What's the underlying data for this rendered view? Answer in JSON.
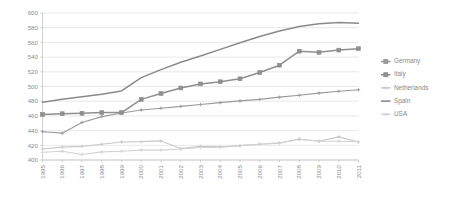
{
  "chart_data": {
    "type": "line",
    "title": "",
    "subtitle": "",
    "xlabel": "",
    "ylabel": "",
    "categories": [
      "1995",
      "1996",
      "1997",
      "1998",
      "1999",
      "2000",
      "2001",
      "2002",
      "2003",
      "2004",
      "2005",
      "2006",
      "2007",
      "2008",
      "2009",
      "2010",
      "2011"
    ],
    "xlim": [
      1995,
      2011
    ],
    "ylim": [
      400,
      600
    ],
    "ytick_values": [
      400,
      420,
      440,
      460,
      480,
      500,
      520,
      540,
      560,
      580,
      600
    ],
    "ytick_labels": [
      "400",
      "420",
      "440",
      "460",
      "480",
      "500",
      "520",
      "540",
      "560",
      "580",
      "600"
    ],
    "grid": "horizontal",
    "legend_position": "right",
    "series": [
      {
        "name": "Germany",
        "color": "#9a9a9a",
        "marker": "plus",
        "values": [
          438.5,
          436.5,
          451.0,
          459.0,
          464.0,
          468.0,
          470.5,
          473.0,
          475.5,
          478.0,
          480.5,
          482.5,
          485.5,
          488.0,
          491.0,
          493.5,
          495.5
        ]
      },
      {
        "name": "Italy",
        "color": "#8f8f8f",
        "marker": "square",
        "values": [
          462.0,
          463.0,
          463.5,
          464.5,
          464.5,
          482.5,
          490.5,
          498.0,
          503.5,
          506.5,
          510.5,
          519.0,
          529.0,
          548.0,
          546.5,
          549.5,
          551.5
        ]
      },
      {
        "name": "Netherlands",
        "color": "#c9c9c9",
        "marker": "plus",
        "values": [
          415.0,
          417.5,
          418.5,
          421.5,
          424.5,
          425.0,
          426.0,
          415.5,
          418.5,
          418.0,
          419.5,
          421.5,
          423.0,
          428.5,
          425.5,
          431.5,
          424.5
        ]
      },
      {
        "name": "Spain",
        "color": "#8a8a8a",
        "marker": "none",
        "values": [
          478.5,
          482.5,
          486.0,
          489.5,
          494.0,
          512.0,
          523.0,
          533.0,
          541.5,
          550.5,
          559.5,
          568.0,
          575.5,
          581.5,
          585.5,
          587.0,
          586.0
        ]
      },
      {
        "name": "USA",
        "color": "#d2d2d2",
        "marker": "plus",
        "values": [
          410.5,
          412.0,
          407.5,
          411.0,
          412.0,
          413.5,
          413.5,
          415.0,
          417.0,
          417.0,
          419.5,
          421.5,
          423.5,
          428.0,
          425.5,
          425.5,
          425.0
        ]
      }
    ],
    "legend": [
      {
        "label": "Germany",
        "color": "#9a9a9a",
        "marker": "square"
      },
      {
        "label": "Italy",
        "color": "#8f8f8f",
        "marker": "square"
      },
      {
        "label": "Netherlands",
        "color": "#c9c9c9",
        "marker": "plus"
      },
      {
        "label": "Spain",
        "color": "#8a8a8a",
        "marker": "none"
      },
      {
        "label": "USA",
        "color": "#d2d2d2",
        "marker": "plus"
      }
    ]
  }
}
